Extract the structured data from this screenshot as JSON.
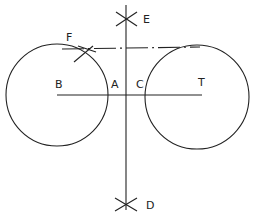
{
  "diagram": {
    "type": "geometric-construction",
    "stroke_color": "#222222",
    "background": "#ffffff",
    "labels": {
      "E": "E",
      "F": "F",
      "B": "B",
      "A": "A",
      "C": "C",
      "T": "T",
      "D": "D"
    },
    "circles": [
      {
        "id": "circle-B",
        "cx": 57,
        "cy": 95,
        "r": 51
      },
      {
        "id": "circle-T",
        "cx": 197,
        "cy": 97,
        "r": 52
      }
    ],
    "lines": {
      "center_line_BT": {
        "x1": 57,
        "y1": 95,
        "x2": 202,
        "y2": 95
      },
      "perpendicular_ED": {
        "x1": 126,
        "y1": 5,
        "x2": 126,
        "y2": 210
      },
      "tangent_dashed": {
        "x1": 60,
        "y1": 48,
        "x2": 200,
        "y2": 47
      }
    },
    "arc_marks": [
      "E",
      "D",
      "F"
    ]
  }
}
